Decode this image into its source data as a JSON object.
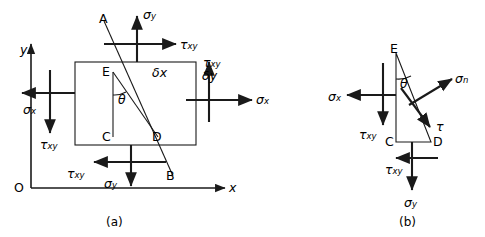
{
  "figure": {
    "title_a": "(a)",
    "title_b": "(b)",
    "axes": {
      "origin_label": "O",
      "x_label": "x",
      "y_label": "y"
    },
    "panel_a": {
      "points": {
        "A": "A",
        "B": "B",
        "C": "C",
        "D": "D",
        "E": "E"
      },
      "angle_label": "θ",
      "dimension_x": "δ",
      "dimension_x_sub": "x",
      "dimension_y": "δ",
      "dimension_y_sub": "y",
      "stresses": {
        "sigma": "σ",
        "tau": "τ",
        "sub_x": "x",
        "sub_y": "y",
        "sub_xy": "xy"
      },
      "labels": [
        {
          "name": "sigma-y-top",
          "symbol": "σ",
          "sub": "y"
        },
        {
          "name": "tau-xy-top",
          "symbol": "τ",
          "sub": "xy"
        },
        {
          "name": "tau-xy-right",
          "symbol": "τ",
          "sub": "xy"
        },
        {
          "name": "sigma-x-right",
          "symbol": "σ",
          "sub": "x"
        },
        {
          "name": "sigma-x-left",
          "symbol": "σ",
          "sub": "x"
        },
        {
          "name": "tau-xy-left",
          "symbol": "τ",
          "sub": "xy"
        },
        {
          "name": "tau-xy-bottom",
          "symbol": "τ",
          "sub": "xy"
        },
        {
          "name": "sigma-y-bottom",
          "symbol": "σ",
          "sub": "y"
        }
      ]
    },
    "panel_b": {
      "points": {
        "C": "C",
        "D": "D",
        "E": "E"
      },
      "angle_label": "θ",
      "labels": [
        {
          "name": "sigma-x-left",
          "symbol": "σ",
          "sub": "x"
        },
        {
          "name": "tau-xy-left",
          "symbol": "τ",
          "sub": "xy"
        },
        {
          "name": "sigma-n",
          "symbol": "σ",
          "sub": "n"
        },
        {
          "name": "tau-normal",
          "symbol": "τ",
          "sub": ""
        },
        {
          "name": "tau-xy-bottom",
          "symbol": "τ",
          "sub": "xy"
        },
        {
          "name": "sigma-y-bottom",
          "symbol": "σ",
          "sub": "y"
        }
      ]
    },
    "colors": {
      "ink": "#1a1a1a",
      "background": "#ffffff"
    }
  }
}
